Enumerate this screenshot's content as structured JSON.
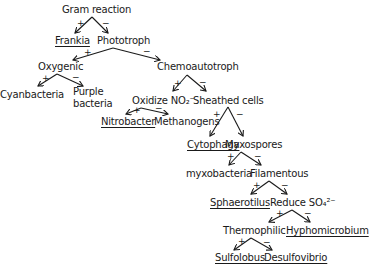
{
  "diagram": {
    "type": "dichotomous-key",
    "nodes": [
      {
        "id": "gram",
        "label": "Gram reaction",
        "x": 62,
        "y": 4,
        "underlined": false
      },
      {
        "id": "frankia",
        "label": "Frankia",
        "x": 55,
        "y": 35,
        "underlined": true
      },
      {
        "id": "phototroph",
        "label": "Phototroph",
        "x": 97,
        "y": 35,
        "underlined": false
      },
      {
        "id": "oxygenic",
        "label": "Oxygenic",
        "x": 38,
        "y": 61,
        "underlined": false
      },
      {
        "id": "chemoautotroph",
        "label": "Chemoautotroph",
        "x": 157,
        "y": 61,
        "underlined": false
      },
      {
        "id": "cyanbacteria",
        "label": "Cyanbacteria",
        "x": 0,
        "y": 89,
        "underlined": false
      },
      {
        "id": "purple",
        "label": "Purple",
        "x": 73,
        "y": 86,
        "underlined": false
      },
      {
        "id": "purple2",
        "label": "bacteria",
        "x": 73,
        "y": 98,
        "underlined": false
      },
      {
        "id": "oxidize",
        "label": "Oxidize NO₂⁻",
        "x": 132,
        "y": 95,
        "underlined": false
      },
      {
        "id": "sheathed",
        "label": "Sheathed cells",
        "x": 193,
        "y": 95,
        "underlined": false
      },
      {
        "id": "nitrobacter",
        "label": "Nitrobacter",
        "x": 101,
        "y": 116,
        "underlined": true
      },
      {
        "id": "methanogens",
        "label": "Methanogens",
        "x": 154,
        "y": 116,
        "underlined": false
      },
      {
        "id": "cytophaga",
        "label": "Cytophaga",
        "x": 187,
        "y": 139,
        "underlined": true
      },
      {
        "id": "myxospores",
        "label": "Myxospores",
        "x": 225,
        "y": 139,
        "underlined": false
      },
      {
        "id": "myxobacteria",
        "label": "myxobacteria",
        "x": 186,
        "y": 168,
        "underlined": false
      },
      {
        "id": "filamentous",
        "label": "Filamentous",
        "x": 250,
        "y": 168,
        "underlined": false
      },
      {
        "id": "sphaerotilus",
        "label": "Sphaerotilus",
        "x": 210,
        "y": 197,
        "underlined": true
      },
      {
        "id": "reduce",
        "label": "Reduce SO₄²⁻",
        "x": 270,
        "y": 197,
        "underlined": false
      },
      {
        "id": "thermophilic",
        "label": "Thermophilic",
        "x": 223,
        "y": 225,
        "underlined": false
      },
      {
        "id": "hyphomicrobium",
        "label": "Hyphomicrobium",
        "x": 286,
        "y": 225,
        "underlined": true
      },
      {
        "id": "sulfolobus",
        "label": "Sulfolobus",
        "x": 215,
        "y": 252,
        "underlined": true
      },
      {
        "id": "desulfovibrio",
        "label": "Desulfovibrio",
        "x": 264,
        "y": 252,
        "underlined": true
      }
    ],
    "edges": [
      {
        "from": [
          92,
          17
        ],
        "to": [
          75,
          33
        ],
        "sign": "+",
        "sx": 77,
        "sy": 19
      },
      {
        "from": [
          92,
          17
        ],
        "to": [
          108,
          33
        ],
        "sign": "−",
        "sx": 102,
        "sy": 19
      },
      {
        "from": [
          113,
          48
        ],
        "to": [
          73,
          60
        ],
        "sign": "+",
        "sx": 84,
        "sy": 48
      },
      {
        "from": [
          113,
          48
        ],
        "to": [
          160,
          60
        ],
        "sign": "−",
        "sx": 143,
        "sy": 47
      },
      {
        "from": [
          57,
          74
        ],
        "to": [
          38,
          86
        ],
        "sign": "+",
        "sx": 42,
        "sy": 74
      },
      {
        "from": [
          57,
          74
        ],
        "to": [
          83,
          86
        ],
        "sign": "−",
        "sx": 72,
        "sy": 73
      },
      {
        "from": [
          187,
          75
        ],
        "to": [
          173,
          91
        ],
        "sign": "+",
        "sx": 174,
        "sy": 79
      },
      {
        "from": [
          187,
          75
        ],
        "to": [
          206,
          91
        ],
        "sign": "−",
        "sx": 199,
        "sy": 78
      },
      {
        "from": [
          141,
          108
        ],
        "to": [
          126,
          114
        ],
        "sign": "+",
        "sx": 133,
        "sy": 106
      },
      {
        "from": [
          141,
          108
        ],
        "to": [
          168,
          114
        ],
        "sign": "−",
        "sx": 155,
        "sy": 104
      },
      {
        "from": [
          228,
          107
        ],
        "to": [
          210,
          136
        ],
        "sign": "+",
        "sx": 213,
        "sy": 110
      },
      {
        "from": [
          228,
          107
        ],
        "to": [
          243,
          136
        ],
        "sign": "−",
        "sx": 236,
        "sy": 110
      },
      {
        "from": [
          241,
          152
        ],
        "to": [
          229,
          165
        ],
        "sign": "+",
        "sx": 227,
        "sy": 152
      },
      {
        "from": [
          241,
          152
        ],
        "to": [
          261,
          165
        ],
        "sign": "−",
        "sx": 254,
        "sy": 152
      },
      {
        "from": [
          269,
          181
        ],
        "to": [
          251,
          194
        ],
        "sign": "+",
        "sx": 253,
        "sy": 181
      },
      {
        "from": [
          269,
          181
        ],
        "to": [
          287,
          194
        ],
        "sign": "−",
        "sx": 281,
        "sy": 181
      },
      {
        "from": [
          292,
          210
        ],
        "to": [
          269,
          222
        ],
        "sign": "+",
        "sx": 276,
        "sy": 209
      },
      {
        "from": [
          292,
          210
        ],
        "to": [
          310,
          222
        ],
        "sign": "−",
        "sx": 304,
        "sy": 209
      },
      {
        "from": [
          251,
          238
        ],
        "to": [
          234,
          250
        ],
        "sign": "+",
        "sx": 238,
        "sy": 237
      },
      {
        "from": [
          251,
          238
        ],
        "to": [
          272,
          250
        ],
        "sign": "−",
        "sx": 263,
        "sy": 238
      }
    ]
  }
}
